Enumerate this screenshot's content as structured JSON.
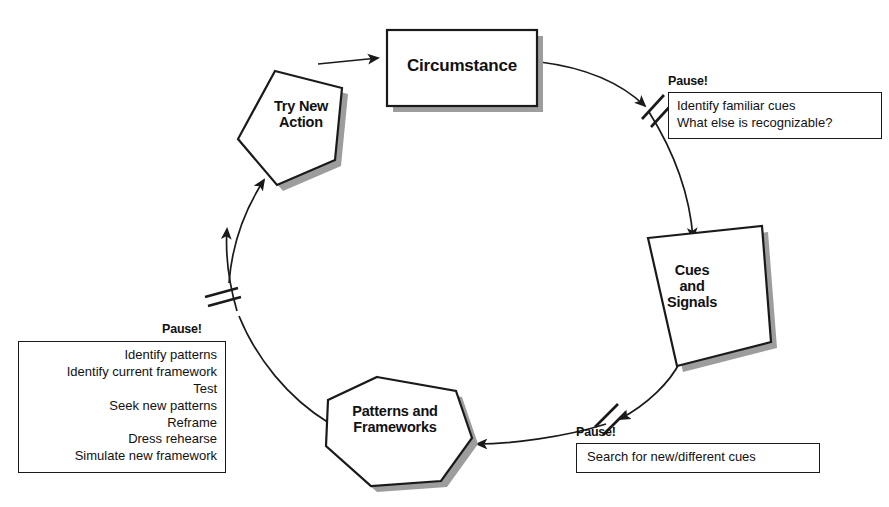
{
  "diagram": {
    "background_color": "#ffffff",
    "line_color": "#1a1a1a",
    "shadow_color": "#9a9a9a",
    "nodes": [
      {
        "id": "circumstance",
        "label": "Circumstance",
        "shape": "rectangle"
      },
      {
        "id": "cues-and-signals",
        "label": "Cues\nand\nSignals",
        "shape": "tilted-quadrilateral"
      },
      {
        "id": "patterns-and-frameworks",
        "label": "Patterns and\nFrameworks",
        "shape": "heptagon"
      },
      {
        "id": "try-new-action",
        "label": "Try New\nAction",
        "shape": "pentagon"
      }
    ],
    "pause_markers": [
      {
        "id": "pause-top-right",
        "title": "Pause!",
        "lines": [
          "Identify familiar cues",
          "What else is recognizable?"
        ]
      },
      {
        "id": "pause-bottom-right",
        "title": "Pause!",
        "lines": [
          "Search for new/different cues"
        ]
      },
      {
        "id": "pause-left",
        "title": "Pause!",
        "lines": [
          "Identify patterns",
          "Identify current framework",
          "Test",
          "Seek new patterns",
          "Reframe",
          "Dress rehearse",
          "Simulate new framework"
        ]
      }
    ]
  }
}
